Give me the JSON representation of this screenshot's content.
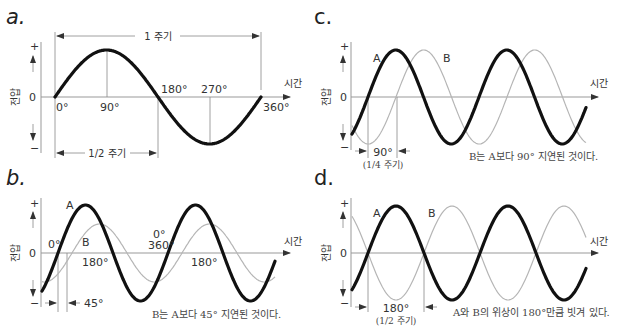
{
  "panels": {
    "a": {
      "letter": "a.",
      "y_axis_label": "전압",
      "y_plus": "+",
      "y_zero": "0",
      "y_minus": "−",
      "x_axis_label": "시간",
      "period_label": "1 주기",
      "half_period_label": "1/2 주기",
      "angles": {
        "deg0": "0°",
        "deg90": "90°",
        "deg180": "180°",
        "deg270": "270°",
        "deg360": "360°"
      }
    },
    "b": {
      "letter": "b.",
      "y_axis_label": "전압",
      "y_plus": "+",
      "y_zero": "0",
      "y_minus": "−",
      "x_axis_label": "시간",
      "wave_a_label": "A",
      "wave_b_label": "B",
      "angle_0": "0°",
      "angle_180_first": "180°",
      "angle_0_second": "0°",
      "angle_360": "360°",
      "angle_180_second": "180°",
      "phase_shift_label": "45°",
      "caption": "B는 A보다 45° 지연된 것이다."
    },
    "c": {
      "letter": "c.",
      "y_axis_label": "전압",
      "y_plus": "+",
      "y_zero": "0",
      "y_minus": "−",
      "x_axis_label": "시간",
      "wave_a_label": "A",
      "wave_b_label": "B",
      "phase_shift_label": "90°",
      "phase_shift_sub": "(1/4 주기)",
      "caption": "B는 A보다 90° 지연된 것이다."
    },
    "d": {
      "letter": "d.",
      "y_axis_label": "전압",
      "y_plus": "+",
      "y_zero": "0",
      "y_minus": "−",
      "x_axis_label": "시간",
      "wave_a_label": "A",
      "wave_b_label": "B",
      "phase_shift_label": "180°",
      "phase_shift_sub": "(1/2 주기)",
      "caption": "A와 B의 위상이 180°만큼 빗겨 있다."
    }
  },
  "colors": {
    "wave_a": "#111111",
    "wave_b": "#b5b5b5",
    "axis": "#999999",
    "text": "#333333"
  }
}
